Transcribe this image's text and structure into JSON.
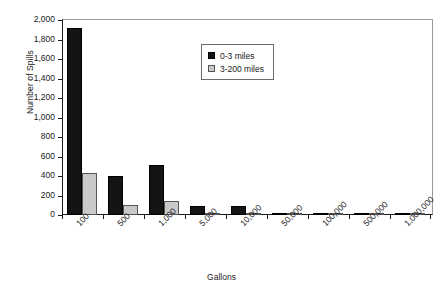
{
  "chart_data": {
    "type": "bar",
    "title": "",
    "xlabel": "Gallons",
    "ylabel": "Number of Spills",
    "categories": [
      "100",
      "500",
      "1,000",
      "5,000",
      "10,000",
      "50,000",
      "100,000",
      "500,000",
      "1,000,000"
    ],
    "series": [
      {
        "name": "0-3 miles",
        "color": "#141414",
        "values": [
          1920,
          400,
          515,
          95,
          88,
          12,
          10,
          2,
          1
        ]
      },
      {
        "name": "3-200 miles",
        "color": "#c9c9c9",
        "values": [
          435,
          105,
          140,
          18,
          20,
          3,
          5,
          1,
          2
        ]
      }
    ],
    "ylim": [
      0,
      2000
    ],
    "ytick_step": 200,
    "yticks": [
      "0",
      "200",
      "400",
      "600",
      "800",
      "1,000",
      "1,200",
      "1,400",
      "1,600",
      "1,800",
      "2,000"
    ],
    "grid": false,
    "legend_position": "upper-center",
    "xtick_rotation": -45
  }
}
